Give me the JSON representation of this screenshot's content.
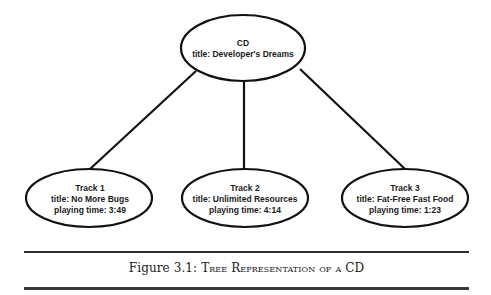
{
  "diagram": {
    "type": "tree",
    "root": {
      "id": "cd",
      "lines": [
        "CD",
        "title: Developer's Dreams"
      ],
      "center": [
        243,
        48
      ],
      "rx": 62,
      "ry": 33
    },
    "children": [
      {
        "id": "track1",
        "lines": [
          "Track 1",
          "title: No More Bugs",
          "playing time: 3:49"
        ],
        "center": [
          89,
          198
        ],
        "rx": 63,
        "ry": 29
      },
      {
        "id": "track2",
        "lines": [
          "Track 2",
          "title: Unlimited Resources",
          "playing time: 4:14"
        ],
        "center": [
          245,
          198
        ],
        "rx": 63,
        "ry": 29
      },
      {
        "id": "track3",
        "lines": [
          "Track 3",
          "title: Fat-Free Fast Food",
          "playing time: 1:23"
        ],
        "center": [
          405,
          198
        ],
        "rx": 63,
        "ry": 29
      }
    ],
    "edges": [
      {
        "from": "cd",
        "to": "track1"
      },
      {
        "from": "cd",
        "to": "track2"
      },
      {
        "from": "cd",
        "to": "track3"
      }
    ]
  },
  "caption": {
    "prefix": "Figure 3.1: ",
    "title": "Tree Representation of a CD"
  }
}
